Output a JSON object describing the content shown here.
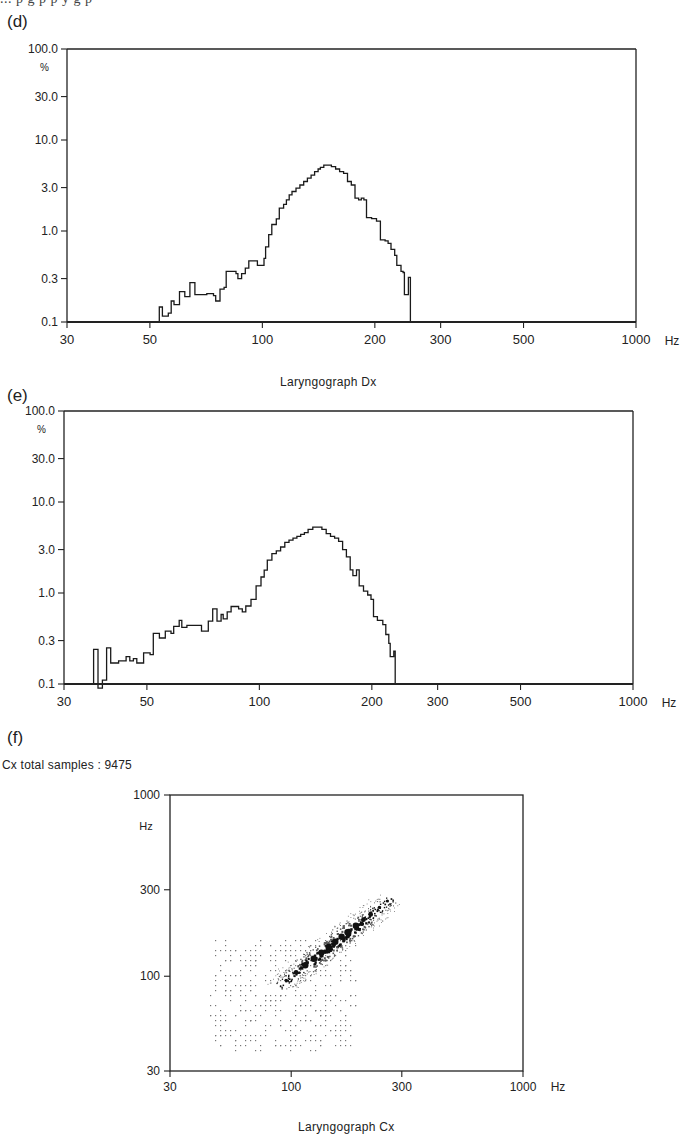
{
  "page": {
    "cutoff_text": "... p    g  p  p                          y  g  p",
    "panels": [
      {
        "label": "(d)",
        "caption": ""
      },
      {
        "label": "(e)",
        "caption": "Laryngograph Dx"
      },
      {
        "label": "(f)",
        "caption": "Laryngograph Cx",
        "samples_text": "Cx total samples : 9475"
      }
    ]
  },
  "chart_data": [
    {
      "id": "d",
      "type": "line",
      "title": "(d)",
      "xlabel": "Hz",
      "ylabel": "%",
      "xscale": "log",
      "yscale": "log",
      "xlim": [
        30,
        1000
      ],
      "ylim": [
        0.1,
        100
      ],
      "xticks": [
        30,
        50,
        100,
        200,
        300,
        500,
        1000
      ],
      "yticks": [
        0.1,
        0.3,
        1.0,
        3.0,
        10.0,
        30.0,
        100.0
      ],
      "ytick_labels": [
        "0.1",
        "0.3",
        "1.0",
        "3.0",
        "10.0",
        "30.0",
        "100.0"
      ],
      "style": "step-histogram",
      "series": [
        {
          "name": "Laryngograph Dx distribution (d)",
          "points": [
            [
              30,
              0.1
            ],
            [
              53,
              0.1
            ],
            [
              53,
              0.146
            ],
            [
              54,
              0.116
            ],
            [
              56,
              0.125
            ],
            [
              57,
              0.17
            ],
            [
              58,
              0.155
            ],
            [
              60,
              0.215
            ],
            [
              62,
              0.19
            ],
            [
              64,
              0.27
            ],
            [
              66,
              0.2
            ],
            [
              68,
              0.2
            ],
            [
              71,
              0.205
            ],
            [
              74,
              0.195
            ],
            [
              75,
              0.17
            ],
            [
              77,
              0.23
            ],
            [
              79,
              0.24
            ],
            [
              80,
              0.36
            ],
            [
              82,
              0.36
            ],
            [
              84,
              0.36
            ],
            [
              85,
              0.34
            ],
            [
              86,
              0.3
            ],
            [
              88,
              0.34
            ],
            [
              90,
              0.39
            ],
            [
              92,
              0.47
            ],
            [
              95,
              0.47
            ],
            [
              97,
              0.42
            ],
            [
              99,
              0.42
            ],
            [
              101,
              0.5
            ],
            [
              102,
              0.67
            ],
            [
              104,
              0.91
            ],
            [
              106,
              1.18
            ],
            [
              109,
              1.36
            ],
            [
              111,
              1.78
            ],
            [
              114,
              1.96
            ],
            [
              116,
              2.2
            ],
            [
              118,
              2.5
            ],
            [
              120,
              2.72
            ],
            [
              123,
              2.95
            ],
            [
              126,
              3.2
            ],
            [
              129,
              3.5
            ],
            [
              132,
              3.8
            ],
            [
              135,
              4.1
            ],
            [
              138,
              4.5
            ],
            [
              141,
              4.8
            ],
            [
              143,
              5.0
            ],
            [
              146,
              5.3
            ],
            [
              150,
              5.3
            ],
            [
              153,
              5.1
            ],
            [
              157,
              4.8
            ],
            [
              161,
              4.5
            ],
            [
              165,
              4.3
            ],
            [
              169,
              3.5
            ],
            [
              173,
              3.2
            ],
            [
              177,
              2.3
            ],
            [
              181,
              2.2
            ],
            [
              184,
              2.3
            ],
            [
              187,
              2.2
            ],
            [
              190,
              1.4
            ],
            [
              196,
              1.37
            ],
            [
              202,
              1.28
            ],
            [
              207,
              0.8
            ],
            [
              213,
              0.78
            ],
            [
              217,
              0.73
            ],
            [
              221,
              0.63
            ],
            [
              226,
              0.54
            ],
            [
              229,
              0.42
            ],
            [
              232,
              0.42
            ],
            [
              235,
              0.36
            ],
            [
              238,
              0.35
            ],
            [
              240,
              0.2
            ],
            [
              244,
              0.2
            ],
            [
              246,
              0.31
            ],
            [
              249,
              0.31
            ],
            [
              249,
              0.1
            ],
            [
              1000,
              0.1
            ]
          ]
        }
      ]
    },
    {
      "id": "e",
      "type": "line",
      "title": "(e)",
      "xlabel": "Hz",
      "ylabel": "%",
      "xscale": "log",
      "yscale": "log",
      "xlim": [
        30,
        1000
      ],
      "ylim": [
        0.1,
        100
      ],
      "xticks": [
        30,
        50,
        100,
        200,
        300,
        500,
        1000
      ],
      "yticks": [
        0.1,
        0.3,
        1.0,
        3.0,
        10.0,
        30.0,
        100.0
      ],
      "ytick_labels": [
        "0.1",
        "0.3",
        "1.0",
        "3.0",
        "10.0",
        "30.0",
        "100.0"
      ],
      "style": "step-histogram",
      "series": [
        {
          "name": "Laryngograph Dx distribution (e)",
          "points": [
            [
              30,
              0.1
            ],
            [
              36,
              0.1
            ],
            [
              36,
              0.24
            ],
            [
              37,
              0.24
            ],
            [
              37,
              0.09
            ],
            [
              38,
              0.1
            ],
            [
              38,
              0.11
            ],
            [
              39,
              0.11
            ],
            [
              39,
              0.25
            ],
            [
              40,
              0.25
            ],
            [
              40,
              0.17
            ],
            [
              41,
              0.17
            ],
            [
              42,
              0.18
            ],
            [
              44,
              0.2
            ],
            [
              45,
              0.18
            ],
            [
              46,
              0.19
            ],
            [
              47,
              0.17
            ],
            [
              48,
              0.17
            ],
            [
              49,
              0.22
            ],
            [
              50,
              0.22
            ],
            [
              51,
              0.21
            ],
            [
              52,
              0.36
            ],
            [
              54,
              0.32
            ],
            [
              55,
              0.32
            ],
            [
              56,
              0.38
            ],
            [
              58,
              0.36
            ],
            [
              59,
              0.43
            ],
            [
              61,
              0.5
            ],
            [
              62,
              0.42
            ],
            [
              64,
              0.44
            ],
            [
              67,
              0.44
            ],
            [
              69,
              0.44
            ],
            [
              70,
              0.38
            ],
            [
              72,
              0.38
            ],
            [
              73,
              0.49
            ],
            [
              75,
              0.67
            ],
            [
              77,
              0.49
            ],
            [
              79,
              0.58
            ],
            [
              80,
              0.52
            ],
            [
              82,
              0.62
            ],
            [
              84,
              0.71
            ],
            [
              86,
              0.71
            ],
            [
              88,
              0.67
            ],
            [
              90,
              0.62
            ],
            [
              92,
              0.72
            ],
            [
              95,
              0.85
            ],
            [
              98,
              1.2
            ],
            [
              101,
              1.5
            ],
            [
              103,
              1.78
            ],
            [
              105,
              2.3
            ],
            [
              108,
              2.7
            ],
            [
              111,
              2.9
            ],
            [
              114,
              3.2
            ],
            [
              117,
              3.6
            ],
            [
              120,
              3.8
            ],
            [
              123,
              4.0
            ],
            [
              126,
              4.2
            ],
            [
              129,
              4.4
            ],
            [
              132,
              4.6
            ],
            [
              135,
              5.0
            ],
            [
              139,
              5.3
            ],
            [
              143,
              5.3
            ],
            [
              147,
              5.0
            ],
            [
              151,
              4.5
            ],
            [
              155,
              4.2
            ],
            [
              159,
              4.0
            ],
            [
              163,
              3.7
            ],
            [
              167,
              3.0
            ],
            [
              171,
              2.5
            ],
            [
              175,
              1.8
            ],
            [
              178,
              1.55
            ],
            [
              182,
              1.8
            ],
            [
              185,
              1.2
            ],
            [
              190,
              1.05
            ],
            [
              195,
              0.95
            ],
            [
              199,
              0.85
            ],
            [
              202,
              0.55
            ],
            [
              207,
              0.5
            ],
            [
              211,
              0.5
            ],
            [
              214,
              0.45
            ],
            [
              218,
              0.35
            ],
            [
              222,
              0.28
            ],
            [
              224,
              0.2
            ],
            [
              227,
              0.2
            ],
            [
              229,
              0.23
            ],
            [
              231,
              0.23
            ],
            [
              231,
              0.1
            ],
            [
              1000,
              0.1
            ]
          ]
        }
      ]
    },
    {
      "id": "f",
      "type": "scatter",
      "title": "(f)",
      "subtitle": "Cx total samples : 9475",
      "xlabel": "Laryngograph Cx",
      "x_unit": "Hz",
      "y_unit": "Hz",
      "xscale": "log",
      "yscale": "log",
      "xlim": [
        30,
        1000
      ],
      "ylim": [
        30,
        1000
      ],
      "xticks": [
        30,
        100,
        300,
        1000
      ],
      "yticks": [
        30,
        100,
        300,
        1000
      ],
      "total_samples": 9475,
      "description": "Density scatter of consecutive-period frequencies; dense diagonal band from ~100 Hz to ~260 Hz, sparse scatter from ~45 Hz to ~190 Hz",
      "dense_band": [
        [
          95,
          95
        ],
        [
          105,
          105
        ],
        [
          115,
          115
        ],
        [
          125,
          125
        ],
        [
          135,
          135
        ],
        [
          145,
          145
        ],
        [
          155,
          155
        ],
        [
          165,
          165
        ],
        [
          175,
          175
        ],
        [
          190,
          190
        ],
        [
          205,
          205
        ],
        [
          220,
          220
        ],
        [
          240,
          240
        ],
        [
          260,
          260
        ]
      ],
      "sparse_region": {
        "x_range": [
          45,
          190
        ],
        "y_range": [
          40,
          160
        ]
      }
    }
  ]
}
